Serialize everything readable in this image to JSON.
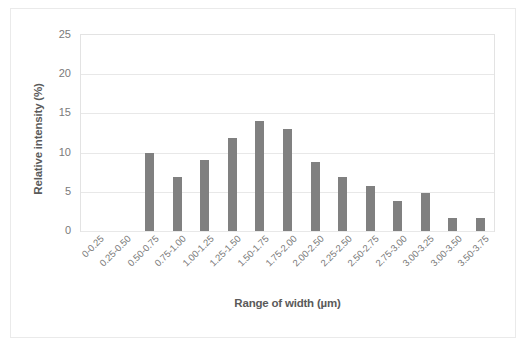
{
  "chart_data": {
    "type": "bar",
    "title": "",
    "subtitle": "",
    "xlabel": "Range of width (µm)",
    "ylabel": "Relative intensity (%)",
    "ylim": [
      0,
      25
    ],
    "yticks": [
      0,
      5,
      10,
      15,
      20,
      25
    ],
    "ytick_labels": [
      "0",
      "5",
      "10",
      "15",
      "20",
      "25"
    ],
    "grid": "horizontal",
    "legend": "none",
    "bar_color": "#808080",
    "gridline_color": "#e8e8e8",
    "plot_border_color": "#e3e3e3",
    "axis_text_color": "#7a7a7a",
    "axis_title_color": "#5a5a5a",
    "categories": [
      "0-0.25",
      "0.25-0.50",
      "0.50-0.75",
      "0.75-1.00",
      "1.00-1.25",
      "1.25-1.50",
      "1.50-1.75",
      "1.75-2.00",
      "2.00-2.50",
      "2.25-2.50",
      "2.50-2.75",
      "2.75-3.00",
      "3.00-3.25",
      "3.00-3.50",
      "3.50-3.75"
    ],
    "values": [
      0,
      0,
      10,
      6.9,
      9,
      11.9,
      14,
      13,
      8.8,
      6.9,
      5.8,
      3.8,
      4.8,
      1.7,
      1.7
    ]
  }
}
